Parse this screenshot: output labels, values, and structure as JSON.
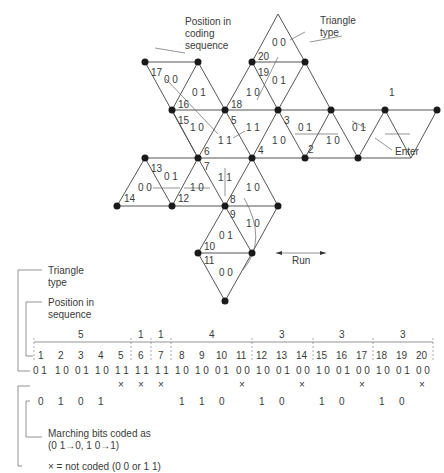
{
  "callouts": {
    "position_label_1": "Position in",
    "position_label_2": "coding",
    "position_label_3": "sequence",
    "triangle_type_1": "Triangle",
    "triangle_type_2": "type",
    "enter": "Enter",
    "run": "Run"
  },
  "mesh": {
    "positions": [
      "1",
      "2",
      "3",
      "4",
      "5",
      "6",
      "7",
      "8",
      "9",
      "10",
      "11",
      "12",
      "13",
      "14",
      "15",
      "16",
      "17",
      "18",
      "19",
      "20"
    ],
    "types": {
      "t20": "0 0",
      "t19": "0 1",
      "t18": "1 0",
      "t17": "0 0",
      "t16": "0 1",
      "t15": "1 0",
      "t5": "1 1",
      "t3": "0 1",
      "t3b": "1 0",
      "t1": "0 1",
      "t2": "1 0",
      "t6": "1 1",
      "t13": "0 1",
      "t14": "0 0",
      "t12": "1 0",
      "t7": "1 1",
      "t4": "1 0",
      "t9": "1 0",
      "t10": "0 1",
      "t11": "0 0"
    }
  },
  "legend": {
    "triangle_type_1": "Triangle",
    "triangle_type_2": "type",
    "position_1": "Position in",
    "position_2": "sequence",
    "marching_1": "Marching bits coded as",
    "marching_2": "(0 1→0, 1 0→1)",
    "not_coded": "× = not coded (0 0 or 1 1)"
  },
  "runs": [
    {
      "length": "5"
    },
    {
      "length": "1"
    },
    {
      "length": "1"
    },
    {
      "length": "4"
    },
    {
      "length": "3"
    },
    {
      "length": "3"
    },
    {
      "length": "3"
    }
  ],
  "sequence": {
    "positions": [
      "1",
      "2",
      "3",
      "4",
      "5",
      "6",
      "7",
      "8",
      "9",
      "10",
      "11",
      "12",
      "13",
      "14",
      "15",
      "16",
      "17",
      "18",
      "19",
      "20"
    ],
    "types": [
      "0 1",
      "1 0",
      "0 1",
      "1 0",
      "1 1",
      "1 1",
      "1 1",
      "1 0",
      "1 0",
      "0 1",
      "0 0",
      "1 0",
      "0 1",
      "0 0",
      "1 0",
      "0 1",
      "0 0",
      "1 0",
      "0 1",
      "0 0"
    ],
    "not_coded": [
      "",
      "",
      "",
      "",
      "×",
      "×",
      "×",
      "",
      "",
      "",
      "×",
      "",
      "",
      "×",
      "",
      "",
      "×",
      "",
      "",
      "×"
    ],
    "coded": [
      "0",
      "1",
      "0",
      "1",
      "",
      "",
      "",
      "1",
      "1",
      "0",
      "",
      "1",
      "0",
      "",
      "1",
      "0",
      "",
      "1",
      "0",
      ""
    ]
  }
}
